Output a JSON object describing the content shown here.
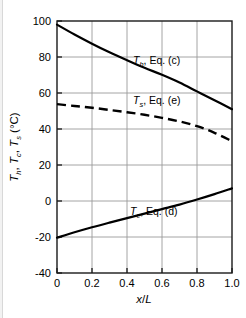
{
  "chart_data": {
    "type": "line",
    "title": "",
    "xlabel": "x/L",
    "ylabel": "T_h, T_c, T_s (°C)",
    "xlim": [
      0,
      1.0
    ],
    "ylim": [
      -40,
      100
    ],
    "grid": true,
    "legend_position": "inline-annotations",
    "xticks": [
      "0",
      "0.2",
      "0.4",
      "0.6",
      "0.8",
      "1.0"
    ],
    "xtick_values": [
      0,
      0.2,
      0.4,
      0.6,
      0.8,
      1.0
    ],
    "yticks": [
      "100",
      "80",
      "60",
      "40",
      "20",
      "0",
      "-20",
      "-40"
    ],
    "ytick_values": [
      100,
      80,
      60,
      40,
      20,
      0,
      -20,
      -40
    ],
    "x": [
      0,
      0.1,
      0.2,
      0.3,
      0.4,
      0.5,
      0.6,
      0.7,
      0.8,
      0.9,
      1.0
    ],
    "series": [
      {
        "name": "Th, Eq. (c)",
        "style": "solid",
        "values": [
          98,
          92.5,
          87.4,
          82.6,
          78.2,
          74.0,
          70.1,
          65.8,
          60.9,
          56.0,
          51.0
        ]
      },
      {
        "name": "Ts, Eq. (e)",
        "style": "dashed",
        "values": [
          53.8,
          52.8,
          51.8,
          50.6,
          49.3,
          47.9,
          46.2,
          44.2,
          41.6,
          37.9,
          33.2
        ]
      },
      {
        "name": "Tc, Eq. (d)",
        "style": "solid",
        "values": [
          -20.4,
          -17.4,
          -14.6,
          -12.0,
          -9.5,
          -7.0,
          -4.5,
          -2.0,
          0.8,
          3.8,
          7.0
        ]
      }
    ],
    "annotations": [
      {
        "id": "label-th",
        "text": "Th, Eq. (c)",
        "symbol": "T",
        "subscript": "h",
        "suffix": ", Eq. (c)",
        "x_px": 133,
        "y_px": 64
      },
      {
        "id": "label-ts",
        "text": "Ts, Eq. (e)",
        "symbol": "T",
        "subscript": "s",
        "suffix": ", Eq. (e)",
        "x_px": 133,
        "y_px": 104
      },
      {
        "id": "label-tc",
        "text": "Tc, Eq. (d)",
        "symbol": "T",
        "subscript": "c",
        "suffix": ", Eq. (d)",
        "x_px": 130,
        "y_px": 215
      }
    ],
    "ylabel_parts": {
      "t1": "T",
      "s1": "h",
      "sep1": ", ",
      "t2": "T",
      "s2": "c",
      "sep2": ", ",
      "t3": "T",
      "s3": "s",
      "units": " (°C)"
    },
    "colors": {
      "curve": "#000000",
      "grid": "#9a9a9a",
      "axis": "#1a1a1a",
      "background": "#ffffff",
      "text": "#000000"
    }
  }
}
